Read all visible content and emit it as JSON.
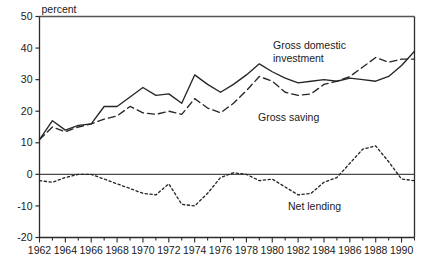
{
  "chart_data": {
    "type": "line",
    "title": "",
    "subtitle": "",
    "xlabel": "",
    "ylabel": "percent",
    "unit_label": "percent",
    "xlim": [
      1962,
      1991
    ],
    "ylim": [
      -20,
      50
    ],
    "yticks": [
      -20,
      -10,
      0,
      10,
      20,
      30,
      40,
      50
    ],
    "ytick_labels": [
      "-20",
      "-10",
      "0",
      "10",
      "20",
      "30",
      "40",
      "50"
    ],
    "xticks": [
      1962,
      1964,
      1966,
      1968,
      1970,
      1972,
      1974,
      1976,
      1978,
      1980,
      1982,
      1984,
      1986,
      1988,
      1990
    ],
    "xtick_labels": [
      "1962",
      "1964",
      "1966",
      "1968",
      "1970",
      "1972",
      "1974",
      "1976",
      "1978",
      "1980",
      "1982",
      "1984",
      "1986",
      "1988",
      "1990"
    ],
    "xminor_step": 1,
    "grid": false,
    "legend": "inline-annotations",
    "zero_line": true,
    "x": [
      1962,
      1963,
      1964,
      1965,
      1966,
      1967,
      1968,
      1969,
      1970,
      1971,
      1972,
      1973,
      1974,
      1975,
      1976,
      1977,
      1978,
      1979,
      1980,
      1981,
      1982,
      1983,
      1984,
      1985,
      1986,
      1987,
      1988,
      1989,
      1990,
      1991
    ],
    "series": [
      {
        "name": "Gross domestic investment",
        "style": "solid",
        "color": "#262626",
        "values": [
          11.0,
          17.0,
          14.0,
          15.5,
          16.0,
          21.5,
          21.5,
          24.5,
          27.5,
          25.0,
          25.5,
          22.5,
          31.5,
          28.5,
          26.0,
          28.5,
          31.5,
          35.0,
          32.5,
          30.5,
          29.0,
          29.5,
          30.0,
          29.5,
          30.5,
          30.0,
          29.5,
          31.0,
          34.5,
          39.0
        ]
      },
      {
        "name": "Gross saving",
        "style": "dashed",
        "color": "#262626",
        "values": [
          11.0,
          15.0,
          13.5,
          15.0,
          16.0,
          17.5,
          18.5,
          21.5,
          19.5,
          19.0,
          20.0,
          19.0,
          24.0,
          21.0,
          19.5,
          22.5,
          26.5,
          31.0,
          29.5,
          26.0,
          25.0,
          25.5,
          28.5,
          29.5,
          31.0,
          34.0,
          37.0,
          35.5,
          36.5,
          36.5
        ]
      },
      {
        "name": "Net lending",
        "style": "dotted",
        "color": "#262626",
        "values": [
          -2.0,
          -2.5,
          -1.0,
          0.0,
          0.0,
          -1.5,
          -3.0,
          -4.5,
          -6.0,
          -6.5,
          -3.0,
          -9.5,
          -10.0,
          -6.0,
          -1.0,
          0.5,
          0.0,
          -2.0,
          -1.5,
          -4.0,
          -6.5,
          -6.0,
          -2.5,
          -1.0,
          3.5,
          8.0,
          9.0,
          4.0,
          -1.5,
          -2.0
        ]
      }
    ],
    "annotations": [
      {
        "id": "gross-domestic-investment",
        "text_line1": "Gross domestic",
        "text_line2": "investment",
        "x": 273,
        "y": 49
      },
      {
        "id": "gross-saving",
        "text_line1": "Gross saving",
        "text_line2": "",
        "x": 258,
        "y": 121
      },
      {
        "id": "net-lending",
        "text_line1": "Net lending",
        "text_line2": "",
        "x": 288,
        "y": 210
      }
    ]
  }
}
